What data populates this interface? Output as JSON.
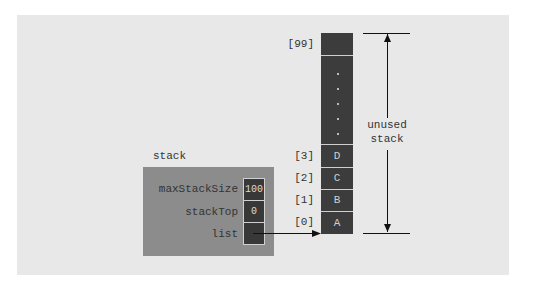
{
  "diagram": {
    "stack_label": "stack",
    "fields": [
      {
        "name": "maxStackSize",
        "value": "100"
      },
      {
        "name": "stackTop",
        "value": "0"
      },
      {
        "name": "list",
        "value": ""
      }
    ],
    "array": {
      "top_index": "[99]",
      "cells": [
        {
          "index": "[3]",
          "value": "D"
        },
        {
          "index": "[2]",
          "value": "C"
        },
        {
          "index": "[1]",
          "value": "B"
        },
        {
          "index": "[0]",
          "value": "A"
        }
      ],
      "ellipsis": "· · · · ·"
    },
    "dimension_label_line1": "unused",
    "dimension_label_line2": "stack"
  },
  "colors": {
    "background": "#e8e8e8",
    "stack_box": "#8c8c8c",
    "cell": "#3c3c3c"
  }
}
